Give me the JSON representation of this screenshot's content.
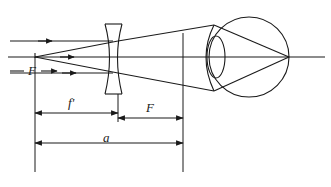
{
  "figure": {
    "stroke_color": "#1a1a1a",
    "background_color": "#ffffff",
    "width": 331,
    "height": 187
  },
  "labels": {
    "focal_point_left": "F",
    "focal_length_lens": "f'",
    "focal_length_eye": "F",
    "object_distance": "a"
  },
  "elements": {
    "lens_name": "diverging-lens",
    "eye_name": "eye-globe",
    "eye_lens_name": "crystalline-lens",
    "cornea_name": "cornea-arc",
    "axis_name": "optical-axis",
    "retina_focus_name": "retina-focus-point",
    "virtual_focus_name": "virtual-focal-point"
  },
  "rays": {
    "incoming_upper": "parallel-ray-upper",
    "incoming_lower": "parallel-ray-lower",
    "incoming_axis": "axial-ray",
    "diverged_upper": "diverged-ray-upper",
    "diverged_lower": "diverged-ray-lower",
    "refracted_upper": "refracted-ray-upper",
    "refracted_lower": "refracted-ray-lower"
  },
  "dimensions": {
    "fprime_from_x": 35,
    "fprime_to_x": 118,
    "F_from_x": 118,
    "F_to_x": 183,
    "a_from_x": 35,
    "a_to_x": 183
  }
}
